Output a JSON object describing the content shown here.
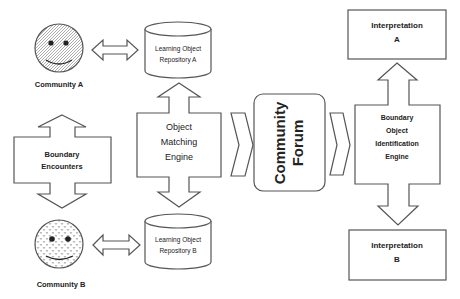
{
  "diagram": {
    "community_a": {
      "label": "Community A",
      "icon": "smiley-face-icon"
    },
    "community_b": {
      "label": "Community B",
      "icon": "smiley-face-icon"
    },
    "repository_a": {
      "line1": "Learning Object",
      "line2": "Repository A"
    },
    "repository_b": {
      "line1": "Learning Object",
      "line2": "Repository B"
    },
    "boundary_encounters": {
      "line1": "Boundary",
      "line2": "Encounters"
    },
    "object_matching_engine": {
      "line1": "Object",
      "line2": "Matching",
      "line3": "Engine"
    },
    "community_forum": {
      "line1": "Community",
      "line2": "Forum"
    },
    "boundary_object_identification_engine": {
      "line1": "Boundary",
      "line2": "Object",
      "line3": "Identification",
      "line4": "Engine"
    },
    "interpretation_a": {
      "line1": "Interpretation",
      "line2": "A"
    },
    "interpretation_b": {
      "line1": "Interpretation",
      "line2": "B"
    }
  }
}
